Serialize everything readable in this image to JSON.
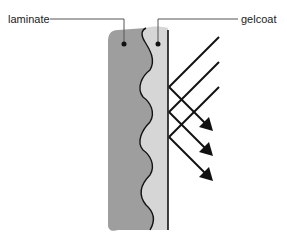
{
  "diagram": {
    "labels": {
      "laminate": "laminate",
      "gelcoat": "gelcoat"
    },
    "colors": {
      "laminate_fill": "#9e9e9e",
      "gelcoat_fill": "#d6d6d6",
      "line": "#111111",
      "background": "#ffffff"
    },
    "rays": {
      "count": 3,
      "incident_direction": "down-left",
      "reflected_direction": "down-right",
      "arrowheads": 3
    }
  }
}
